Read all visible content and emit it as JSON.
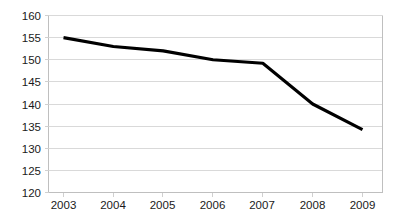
{
  "chart_data": {
    "type": "line",
    "title": "",
    "subtitle": "",
    "xlabel": "",
    "ylabel": "",
    "categories": [
      "2003",
      "2004",
      "2005",
      "2006",
      "2007",
      "2008",
      "2009"
    ],
    "x": [
      2003,
      2004,
      2005,
      2006,
      2007,
      2008,
      2009
    ],
    "series": [
      {
        "name": "",
        "values": [
          155,
          153,
          152,
          150,
          149.2,
          140,
          134.2
        ],
        "color": "#000000"
      }
    ],
    "values": [
      155,
      153,
      152,
      150,
      149.2,
      140,
      134.2
    ],
    "ylim": [
      120,
      160
    ],
    "xlim": [
      2003,
      2009
    ],
    "y_ticks": [
      120,
      125,
      130,
      135,
      140,
      145,
      150,
      155,
      160
    ],
    "y_tick_labels": [
      "120",
      "125",
      "130",
      "135",
      "140",
      "145",
      "150",
      "155",
      "160"
    ],
    "x_ticks": [
      2003,
      2004,
      2005,
      2006,
      2007,
      2008,
      2009
    ],
    "x_tick_labels": [
      "2003",
      "2004",
      "2005",
      "2006",
      "2007",
      "2008",
      "2009"
    ],
    "grid": "horizontal",
    "grid_color": "#d9d9d9",
    "legend": "none",
    "background_color": "#ffffff",
    "markers": "none",
    "annotations": []
  },
  "axes": {
    "y_labels": {
      "t160": "160",
      "t155": "155",
      "t150": "150",
      "t145": "145",
      "t140": "140",
      "t135": "135",
      "t130": "130",
      "t125": "125",
      "t120": "120"
    },
    "x_labels": {
      "c2003": "2003",
      "c2004": "2004",
      "c2005": "2005",
      "c2006": "2006",
      "c2007": "2007",
      "c2008": "2008",
      "c2009": "2009"
    }
  }
}
